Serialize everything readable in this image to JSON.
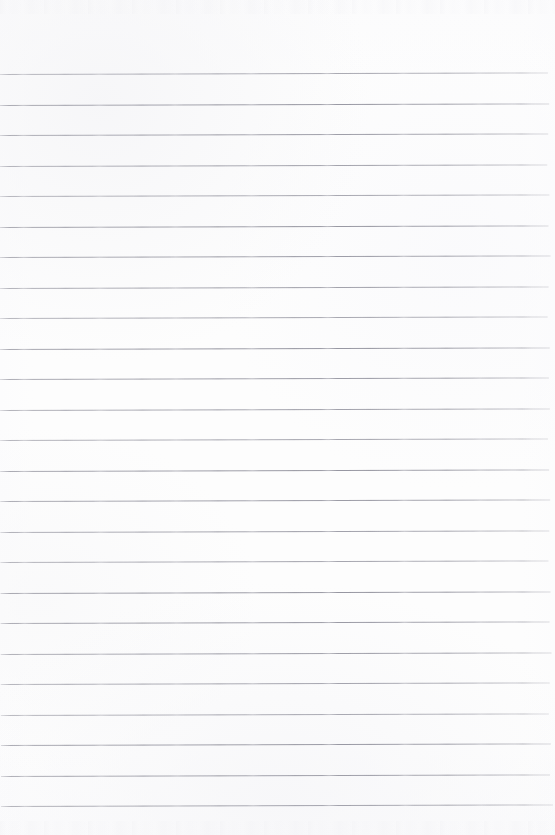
{
  "document": {
    "kind": "scanned-ruled-paper",
    "title": "Blank ruled notebook page",
    "width_px": 555,
    "height_px": 835,
    "content_text": "",
    "has_handwriting": false,
    "has_printed_text": false,
    "has_margin_line": false,
    "orientation": "portrait"
  },
  "colors": {
    "paper_background": "#fdfdfd",
    "rule_line": "#a0a0aa",
    "rule_line_light": "#bcbcc4",
    "page_edge": "#ffffff"
  },
  "ruling": {
    "style": "wide-ruled horizontal lines",
    "line_count": 25,
    "line_spacing_px": 30.5,
    "line_thickness_px": 1,
    "first_line_y_px": 74,
    "last_line_y_px": 806,
    "line_start_x_px": 0,
    "line_end_x_px": 549,
    "skew_degrees": -0.16,
    "line_y_positions": [
      74,
      104.5,
      135,
      165.5,
      196,
      226.5,
      257,
      287.5,
      318,
      348.5,
      379,
      409.5,
      440,
      470.5,
      501,
      531.5,
      562,
      592.5,
      623,
      653.5,
      684,
      714.5,
      745,
      775.5,
      806
    ],
    "line_widths_px": [
      549,
      550,
      549,
      548,
      550,
      549,
      551,
      549,
      548,
      550,
      549,
      550,
      548,
      549,
      550,
      549,
      548,
      550,
      549,
      551,
      549,
      548,
      550,
      549,
      552
    ]
  },
  "margins": {
    "top_blank_px": 74,
    "bottom_blank_px": 29,
    "left_px": 0,
    "right_px": 6
  }
}
